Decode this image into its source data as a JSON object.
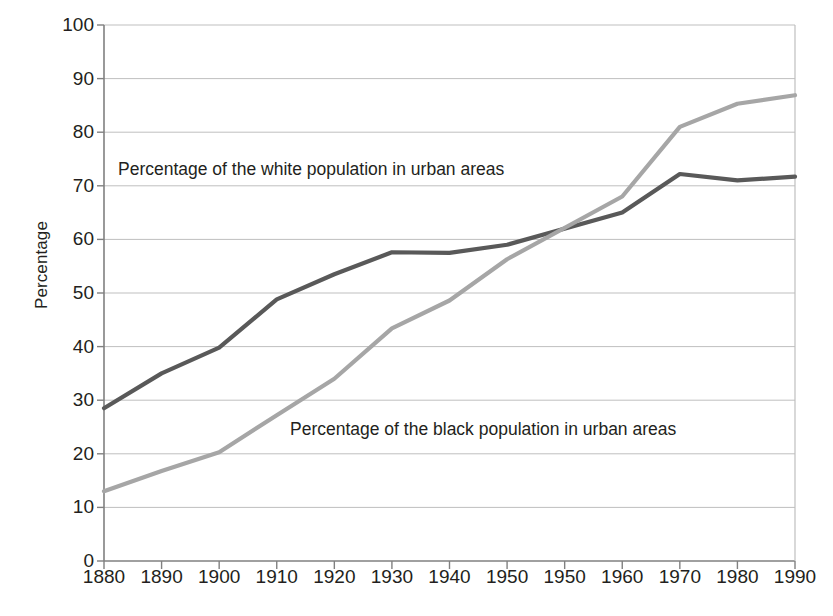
{
  "chart_data": {
    "type": "line",
    "title": "",
    "subtitle": "",
    "xlabel": "",
    "ylabel": "Percentage",
    "xlim": [
      1880,
      1990
    ],
    "ylim": [
      0,
      100
    ],
    "grid": true,
    "legend_position": "inline-annotations",
    "x": [
      1880,
      1890,
      1900,
      1910,
      1920,
      1930,
      1940,
      1950,
      1960,
      1970,
      1980,
      1990
    ],
    "xtick_labels": [
      "1880",
      "1890",
      "1900",
      "1910",
      "1920",
      "1930",
      "1940",
      "1950",
      "1950",
      "1960",
      "1970",
      "1980",
      "1990"
    ],
    "ytick_labels": [
      "0",
      "10",
      "20",
      "30",
      "40",
      "50",
      "60",
      "70",
      "80",
      "90",
      "100"
    ],
    "yticks": [
      0,
      10,
      20,
      30,
      40,
      50,
      60,
      70,
      80,
      90,
      100
    ],
    "series": [
      {
        "name": "Percentage of the white population in urban areas",
        "color": "#595959",
        "values": [
          28.5,
          35.0,
          39.8,
          48.8,
          53.5,
          57.6,
          57.5,
          59.0,
          65.0,
          72.2,
          71.0,
          71.7
        ]
      },
      {
        "name": "Percentage of the black population in urban areas",
        "color": "#a6a6a6",
        "values": [
          13.0,
          16.8,
          20.3,
          27.2,
          34.0,
          43.4,
          48.6,
          56.3,
          68.0,
          81.0,
          85.3,
          86.9
        ]
      }
    ],
    "annotations": [
      {
        "text": "Percentage of the white population in urban areas",
        "x": 1885,
        "y": 74
      },
      {
        "text": "Percentage of the black population in urban areas",
        "x": 1911,
        "y": 26
      }
    ]
  },
  "axes": {
    "y_title": "Percentage"
  },
  "colors": {
    "white_series": "#595959",
    "black_series": "#a6a6a6",
    "axis": "#808080",
    "grid": "#bfbfbf",
    "text": "#231f20",
    "background": "#ffffff"
  }
}
